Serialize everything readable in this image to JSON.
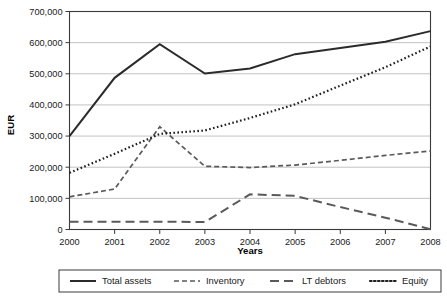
{
  "chart_data": {
    "type": "line",
    "title": "",
    "xlabel": "Years",
    "ylabel": "EUR",
    "categories": [
      "2000",
      "2001",
      "2002",
      "2003",
      "2004",
      "2005",
      "2006",
      "2007",
      "2008"
    ],
    "x": [
      2000,
      2001,
      2002,
      2003,
      2004,
      2005,
      2006,
      2007,
      2008
    ],
    "ylim": [
      0,
      700000
    ],
    "ytick_values": [
      0,
      100000,
      200000,
      300000,
      400000,
      500000,
      600000,
      700000
    ],
    "ytick_labels": [
      "0",
      "100,000",
      "200,000",
      "300,000",
      "400,000",
      "500,000",
      "600,000",
      "700,000"
    ],
    "grid": true,
    "legend_position": "bottom",
    "series": [
      {
        "name": "Total assets",
        "style": "solid",
        "color": "#2b2b2b",
        "values": [
          300000,
          487000,
          595000,
          501000,
          517000,
          563000,
          583000,
          603000,
          637000
        ]
      },
      {
        "name": "Inventory",
        "style": "short-dash",
        "color": "#5a5a5a",
        "values": [
          105000,
          130000,
          330000,
          203000,
          199000,
          207000,
          222000,
          238000,
          252000
        ]
      },
      {
        "name": "LT debtors",
        "style": "long-dash",
        "color": "#5a5a5a",
        "values": [
          25000,
          25000,
          25000,
          24000,
          113000,
          108000,
          72000,
          38000,
          1000
        ]
      },
      {
        "name": "Equity",
        "style": "dotted",
        "color": "#1f1f1f",
        "values": [
          182000,
          243000,
          307000,
          318000,
          358000,
          402000,
          462000,
          521000,
          588000
        ]
      }
    ]
  },
  "legend": {
    "items": [
      {
        "label": "Total assets",
        "style": "solid"
      },
      {
        "label": "Inventory",
        "style": "short-dash"
      },
      {
        "label": "LT debtors",
        "style": "long-dash"
      },
      {
        "label": "Equity",
        "style": "dotted"
      }
    ]
  },
  "colors": {
    "background": "#ffffff",
    "axis": "#3a3a3a",
    "grid": "#a8a8a8",
    "total_assets": "#2b2b2b",
    "inventory": "#5a5a5a",
    "lt_debtors": "#5a5a5a",
    "equity": "#1f1f1f"
  }
}
